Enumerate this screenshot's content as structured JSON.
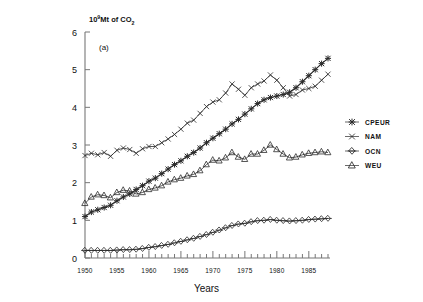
{
  "figure": {
    "panel_label": "(a)",
    "y_axis_label_html": "10^9 Mt of CO2",
    "y_axis_label_base": "10",
    "y_axis_label_exp": "9",
    "y_axis_label_mid": "Mt of CO",
    "y_axis_label_sub": "2",
    "x_axis_title": "Years"
  },
  "legend": {
    "position": "right",
    "items": [
      {
        "label": "CPEUR",
        "marker": "asterisk"
      },
      {
        "label": "NAM",
        "marker": "cross"
      },
      {
        "label": "OCN",
        "marker": "diamond"
      },
      {
        "label": "WEU",
        "marker": "triangle"
      }
    ]
  },
  "chart_data": {
    "type": "line",
    "title": "",
    "subtitle": "(a)",
    "xlabel": "Years",
    "ylabel": "10⁹ Mt of CO₂",
    "xlim": [
      1950,
      1988
    ],
    "ylim": [
      0,
      6
    ],
    "grid": false,
    "legend_position": "right",
    "x_tick_labels": [
      "1950",
      "1955",
      "1960",
      "1965",
      "1970",
      "1975",
      "1980",
      "1985"
    ],
    "x_tick_values": [
      1950,
      1955,
      1960,
      1965,
      1970,
      1975,
      1980,
      1985
    ],
    "x_minor_tick_step": 1,
    "y_tick_labels": [
      "0",
      "1",
      "2",
      "3",
      "4",
      "5",
      "6"
    ],
    "y_tick_values": [
      0,
      1,
      2,
      3,
      4,
      5,
      6
    ],
    "x": [
      1950,
      1951,
      1952,
      1953,
      1954,
      1955,
      1956,
      1957,
      1958,
      1959,
      1960,
      1961,
      1962,
      1963,
      1964,
      1965,
      1966,
      1967,
      1968,
      1969,
      1970,
      1971,
      1972,
      1973,
      1974,
      1975,
      1976,
      1977,
      1978,
      1979,
      1980,
      1981,
      1982,
      1983,
      1984,
      1985,
      1986,
      1987,
      1988
    ],
    "series": [
      {
        "name": "CPEUR",
        "marker": "asterisk",
        "values": [
          1.1,
          1.22,
          1.28,
          1.34,
          1.4,
          1.52,
          1.62,
          1.7,
          1.82,
          1.92,
          2.04,
          2.12,
          2.24,
          2.36,
          2.48,
          2.58,
          2.7,
          2.8,
          2.92,
          3.06,
          3.18,
          3.3,
          3.42,
          3.56,
          3.68,
          3.82,
          3.96,
          4.1,
          4.2,
          4.26,
          4.3,
          4.34,
          4.4,
          4.52,
          4.68,
          4.84,
          5.0,
          5.16,
          5.3
        ]
      },
      {
        "name": "NAM",
        "marker": "cross",
        "values": [
          2.72,
          2.78,
          2.74,
          2.8,
          2.7,
          2.86,
          2.92,
          2.88,
          2.78,
          2.9,
          2.96,
          2.96,
          3.06,
          3.16,
          3.28,
          3.42,
          3.58,
          3.66,
          3.84,
          4.02,
          4.14,
          4.2,
          4.38,
          4.62,
          4.48,
          4.32,
          4.52,
          4.62,
          4.7,
          4.86,
          4.72,
          4.52,
          4.3,
          4.34,
          4.46,
          4.5,
          4.56,
          4.72,
          4.88
        ]
      },
      {
        "name": "OCN",
        "marker": "diamond",
        "values": [
          0.2,
          0.2,
          0.2,
          0.2,
          0.2,
          0.21,
          0.22,
          0.22,
          0.23,
          0.25,
          0.28,
          0.3,
          0.33,
          0.36,
          0.4,
          0.44,
          0.48,
          0.52,
          0.57,
          0.62,
          0.68,
          0.74,
          0.8,
          0.86,
          0.9,
          0.92,
          0.96,
          0.99,
          1.0,
          1.02,
          1.0,
          0.99,
          0.98,
          0.99,
          1.0,
          1.02,
          1.03,
          1.04,
          1.05
        ]
      },
      {
        "name": "WEU",
        "marker": "triangle",
        "values": [
          1.45,
          1.62,
          1.68,
          1.66,
          1.6,
          1.74,
          1.8,
          1.78,
          1.7,
          1.74,
          1.82,
          1.86,
          1.92,
          2.02,
          2.08,
          2.12,
          2.18,
          2.22,
          2.32,
          2.48,
          2.6,
          2.58,
          2.66,
          2.8,
          2.68,
          2.62,
          2.76,
          2.76,
          2.86,
          3.0,
          2.88,
          2.76,
          2.66,
          2.68,
          2.74,
          2.78,
          2.8,
          2.82,
          2.8
        ]
      }
    ]
  }
}
